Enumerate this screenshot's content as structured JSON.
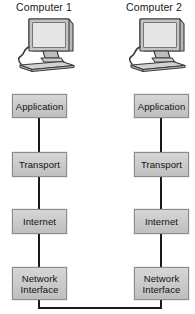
{
  "diagram": {
    "title_left": "Computer 1",
    "title_right": "Computer 2",
    "icon_left": "desktop-computer-icon",
    "icon_right": "desktop-computer-icon",
    "layers": [
      {
        "id": "application",
        "label_line1": "Application",
        "label_line2": ""
      },
      {
        "id": "transport",
        "label_line1": "Transport",
        "label_line2": ""
      },
      {
        "id": "internet",
        "label_line1": "Internet",
        "label_line2": ""
      },
      {
        "id": "network-interface",
        "label_line1": "Network",
        "label_line2": "Interface"
      }
    ],
    "colors": {
      "box_fill": "#c9c9c9",
      "box_border": "#8c8c8c",
      "line": "#1a1a1a",
      "text": "#111111",
      "background": "#ffffff",
      "icon_screen": "#d9d9d9",
      "icon_body": "#b5b5b5",
      "icon_outline": "#3a3a3a"
    },
    "connection": {
      "name": "network-bus-link",
      "description": "line joining both Network Interface layers"
    }
  }
}
